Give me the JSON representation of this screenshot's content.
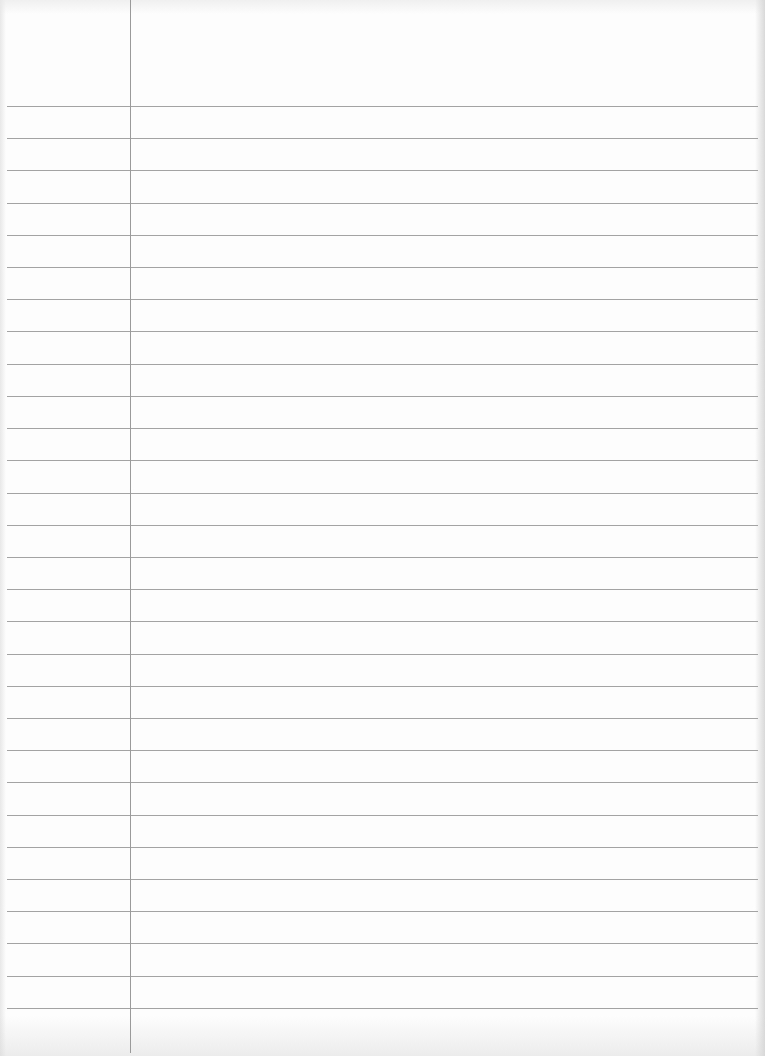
{
  "page": {
    "type": "ruled-notebook-paper",
    "width": 765,
    "height": 1056,
    "paper_color": "#fdfdfd",
    "line_color": "#a3a3a3",
    "margin_line_color": "#9a9a9a",
    "margin_line_x": 130,
    "first_line_y": 106,
    "line_spacing": 32.21,
    "line_count": 29,
    "line_left": 7,
    "line_right": 758,
    "text": ""
  }
}
